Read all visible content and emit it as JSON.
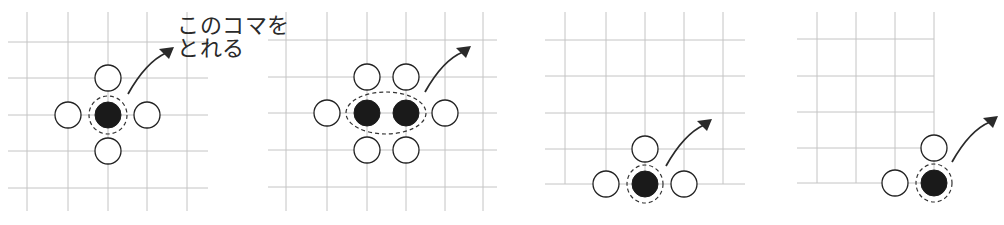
{
  "caption": {
    "line1": "このコマを",
    "line2": "とれる"
  },
  "colors": {
    "grid": "#c4c4c4",
    "stone_outline": "#222222",
    "black_stone": "#1a1a1a",
    "arrow": "#2a2a2a"
  },
  "diagrams": [
    {
      "name": "center-single",
      "vlines": {
        "xs": [
          27,
          68,
          108,
          147,
          187
        ],
        "y1": 12,
        "y2": 211
      },
      "hlines": {
        "ys": [
          42,
          78,
          115,
          151,
          188
        ],
        "x1": 8,
        "x2": 208
      },
      "white": [
        [
          108,
          78
        ],
        [
          68,
          115
        ],
        [
          147,
          115
        ],
        [
          108,
          151
        ]
      ],
      "black": [
        [
          108,
          115
        ]
      ],
      "ring": {
        "cx": 108,
        "cy": 115,
        "rx": 19,
        "ry": 19
      },
      "arrow": {
        "d": "M128 94 Q146 62 166 53",
        "tip": [
          174,
          47
        ]
      }
    },
    {
      "name": "center-double",
      "vlines": {
        "xs": [
          286,
          327,
          367,
          406,
          445,
          483
        ],
        "y1": 12,
        "y2": 211
      },
      "hlines": {
        "ys": [
          40,
          77,
          113,
          150,
          187
        ],
        "x1": 268,
        "x2": 497
      },
      "white": [
        [
          367,
          77
        ],
        [
          406,
          77
        ],
        [
          327,
          113
        ],
        [
          445,
          113
        ],
        [
          367,
          150
        ],
        [
          406,
          150
        ]
      ],
      "black": [
        [
          367,
          113
        ],
        [
          406,
          113
        ]
      ],
      "ring": {
        "cx": 386,
        "cy": 113,
        "rx": 40,
        "ry": 21
      },
      "arrow": {
        "d": "M425 92 Q443 60 463 52",
        "tip": [
          471,
          46
        ]
      }
    },
    {
      "name": "edge",
      "vlines": {
        "xs": [
          565,
          606,
          645,
          684,
          723
        ],
        "y1": 12,
        "y2": 184
      },
      "hlines": {
        "ys": [
          40,
          76,
          113,
          149,
          184
        ],
        "x1": 545,
        "x2": 745
      },
      "white": [
        [
          645,
          149
        ],
        [
          606,
          184
        ],
        [
          684,
          184
        ]
      ],
      "black": [
        [
          645,
          184
        ]
      ],
      "ring": {
        "cx": 645,
        "cy": 184,
        "rx": 18,
        "ry": 19
      },
      "arrow": {
        "d": "M666 166 Q684 134 704 125",
        "tip": [
          712,
          119
        ]
      }
    },
    {
      "name": "corner",
      "vlines": {
        "xs": [
          817,
          856,
          895,
          934
        ],
        "y1": 12,
        "y2": 183
      },
      "hlines": {
        "ys": [
          39,
          76,
          112,
          148,
          183
        ],
        "x1": 797,
        "x2": 934
      },
      "white": [
        [
          934,
          148
        ],
        [
          895,
          183
        ]
      ],
      "black": [
        [
          934,
          183
        ]
      ],
      "ring": {
        "cx": 934,
        "cy": 183,
        "rx": 18,
        "ry": 19
      },
      "arrow": {
        "d": "M952 162 Q970 130 990 122",
        "tip": [
          998,
          116
        ]
      }
    }
  ]
}
